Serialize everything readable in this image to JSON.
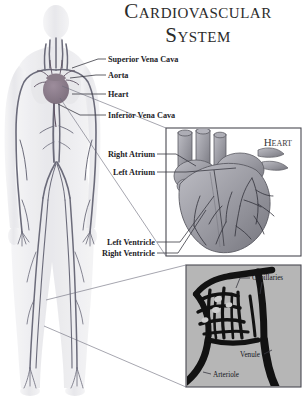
{
  "figure": {
    "title_line1": "Cardiovascular",
    "title_line2": "System",
    "background_color": "#ffffff",
    "ink_color": "#1d1d28"
  },
  "body_diagram": {
    "name": "human-body-vascular-figure",
    "silhouette_color": "#e9e9ec",
    "vessel_color": "#6b6b7a",
    "heart_color": "#8d7f8c"
  },
  "labels": [
    {
      "id": "superior-vena-cava",
      "text": "Superior Vena Cava",
      "x": 108,
      "y": 62
    },
    {
      "id": "aorta",
      "text": "Aorta",
      "x": 108,
      "y": 78
    },
    {
      "id": "heart",
      "text": "Heart",
      "x": 108,
      "y": 97
    },
    {
      "id": "inferior-vena-cava",
      "text": "Inferior Vena Cava",
      "x": 108,
      "y": 118
    },
    {
      "id": "right-atrium",
      "text": "Right Atrium",
      "x": 155,
      "y": 157,
      "align": "end"
    },
    {
      "id": "left-atrium",
      "text": "Left Atrium",
      "x": 155,
      "y": 175,
      "align": "end"
    },
    {
      "id": "left-ventricle",
      "text": "Left Ventricle",
      "x": 155,
      "y": 245,
      "align": "end"
    },
    {
      "id": "right-ventricle",
      "text": "Right Ventricle",
      "x": 155,
      "y": 256,
      "align": "end"
    }
  ],
  "heart_inset": {
    "name": "heart-detail-inset",
    "title": "Heart",
    "frame": {
      "x": 166,
      "y": 128,
      "width": 135,
      "height": 128
    },
    "background_color": "#ffffff",
    "organ_color": "#9a9aa2"
  },
  "capillary_inset": {
    "name": "capillary-bed-inset",
    "frame": {
      "x": 186,
      "y": 265,
      "width": 115,
      "height": 122
    },
    "background_color": "#b6b6b6",
    "vessel_color": "#121212",
    "labels": [
      {
        "id": "capillaries",
        "text": "Capillaries",
        "x": 252,
        "y": 280
      },
      {
        "id": "venule",
        "text": "Venule",
        "x": 240,
        "y": 357
      },
      {
        "id": "arteriole",
        "text": "Arteriole",
        "x": 213,
        "y": 377
      }
    ]
  },
  "footer": {
    "name": "cut-off-caption",
    "text": ""
  }
}
